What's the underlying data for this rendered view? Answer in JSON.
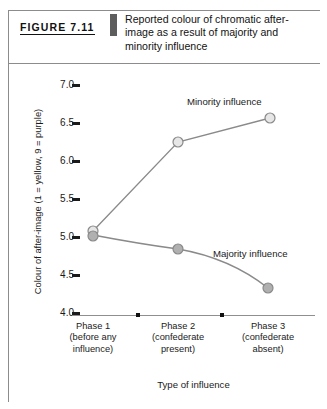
{
  "figure": {
    "tag": "FIGURE 7.11",
    "caption_lines": [
      "Reported colour of chromatic after-",
      "image as a result of majority and",
      "minority influence"
    ],
    "caption_full": "Reported colour of chromatic after-image as a result of majority and minority influence"
  },
  "chart_data": {
    "type": "line",
    "xlabel": "Type of influence",
    "ylabel": "Colour of after-image (1 = yellow, 9 = purple)",
    "categories": [
      "Phase 1\n(before any\ninfluence)",
      "Phase 2\n(confederate\npresent)",
      "Phase 3\n(confederate\nabsent)"
    ],
    "category_lines": [
      [
        "Phase 1",
        "(before any",
        "influence)"
      ],
      [
        "Phase 2",
        "(confederate",
        "present)"
      ],
      [
        "Phase 3",
        "(confederate",
        "absent)"
      ]
    ],
    "series": [
      {
        "name": "Minority influence",
        "values": [
          5.05,
          6.3,
          6.6
        ],
        "marker": "open-circle",
        "marker_fill": "#e0e0e0",
        "marker_stroke": "#8a8a8a"
      },
      {
        "name": "Majority influence",
        "values": [
          5.0,
          4.8,
          4.3
        ],
        "marker": "filled-circle",
        "marker_fill": "#a8a8a8",
        "marker_stroke": "#8a8a8a"
      }
    ],
    "ylim": [
      4.0,
      7.0
    ],
    "ytick_values": [
      "7.0",
      "6.5",
      "6.0",
      "5.5",
      "5.0",
      "4.5",
      "4.0"
    ],
    "grid": false,
    "legend": "inline-annotations",
    "line_color": "#8a8a8a"
  },
  "colors": {
    "frame": "#8c8c8c",
    "axis": "#8f8f8f",
    "text": "#1a1a1a",
    "divider": "#5d5d5d",
    "line": "#8a8a8a",
    "marker_open": "#e0e0e0",
    "marker_filled": "#a8a8a8"
  }
}
